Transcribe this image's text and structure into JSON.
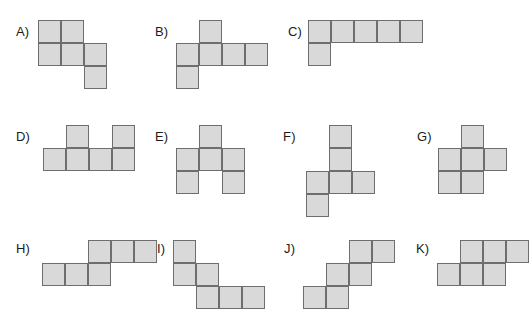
{
  "page": {
    "background_color": "#ffffff",
    "width": 532,
    "height": 327
  },
  "style": {
    "cell_size": 23,
    "cell_fill": "#d9d9d9",
    "cell_stroke": "#6e6e6e",
    "label_color": "#1b1b1b",
    "label_font_size": 13
  },
  "options": [
    {
      "id": "a",
      "label": "A)",
      "label_x": 16,
      "label_y": 25,
      "grid_x": 38,
      "grid_y": 20,
      "cells": [
        [
          0,
          0
        ],
        [
          1,
          0
        ],
        [
          0,
          1
        ],
        [
          1,
          1
        ],
        [
          2,
          1
        ],
        [
          2,
          2
        ]
      ]
    },
    {
      "id": "b",
      "label": "B)",
      "label_x": 155,
      "label_y": 25,
      "grid_x": 176,
      "grid_y": 20,
      "cells": [
        [
          1,
          0
        ],
        [
          0,
          1
        ],
        [
          1,
          1
        ],
        [
          2,
          1
        ],
        [
          3,
          1
        ],
        [
          0,
          2
        ]
      ]
    },
    {
      "id": "c",
      "label": "C)",
      "label_x": 288,
      "label_y": 25,
      "grid_x": 308,
      "grid_y": 20,
      "cells": [
        [
          0,
          0
        ],
        [
          1,
          0
        ],
        [
          2,
          0
        ],
        [
          3,
          0
        ],
        [
          4,
          0
        ],
        [
          0,
          1
        ]
      ]
    },
    {
      "id": "d",
      "label": "D)",
      "label_x": 16,
      "label_y": 130,
      "grid_x": 43,
      "grid_y": 125,
      "cells": [
        [
          1,
          0
        ],
        [
          3,
          0
        ],
        [
          0,
          1
        ],
        [
          1,
          1
        ],
        [
          2,
          1
        ],
        [
          3,
          1
        ]
      ]
    },
    {
      "id": "e",
      "label": "E)",
      "label_x": 155,
      "label_y": 130,
      "grid_x": 176,
      "grid_y": 125,
      "cells": [
        [
          1,
          0
        ],
        [
          0,
          1
        ],
        [
          1,
          1
        ],
        [
          2,
          1
        ],
        [
          0,
          2
        ],
        [
          2,
          2
        ]
      ]
    },
    {
      "id": "f",
      "label": "F)",
      "label_x": 283,
      "label_y": 130,
      "grid_x": 306,
      "grid_y": 125,
      "cells": [
        [
          1,
          0
        ],
        [
          1,
          1
        ],
        [
          0,
          2
        ],
        [
          1,
          2
        ],
        [
          2,
          2
        ],
        [
          0,
          3
        ]
      ]
    },
    {
      "id": "g",
      "label": "G)",
      "label_x": 417,
      "label_y": 130,
      "grid_x": 438,
      "grid_y": 125,
      "cells": [
        [
          1,
          0
        ],
        [
          0,
          1
        ],
        [
          1,
          1
        ],
        [
          2,
          1
        ],
        [
          0,
          2
        ],
        [
          1,
          2
        ]
      ]
    },
    {
      "id": "h",
      "label": "H)",
      "label_x": 16,
      "label_y": 242,
      "grid_x": 42,
      "grid_y": 240,
      "cells": [
        [
          2,
          0
        ],
        [
          3,
          0
        ],
        [
          4,
          0
        ],
        [
          0,
          1
        ],
        [
          1,
          1
        ],
        [
          2,
          1
        ]
      ]
    },
    {
      "id": "i",
      "label": "I)",
      "label_x": 157,
      "label_y": 242,
      "grid_x": 173,
      "grid_y": 240,
      "cells": [
        [
          0,
          0
        ],
        [
          0,
          1
        ],
        [
          1,
          1
        ],
        [
          1,
          2
        ],
        [
          2,
          2
        ],
        [
          3,
          2
        ]
      ]
    },
    {
      "id": "j",
      "label": "J)",
      "label_x": 284,
      "label_y": 242,
      "grid_x": 303,
      "grid_y": 240,
      "cells": [
        [
          2,
          0
        ],
        [
          3,
          0
        ],
        [
          1,
          1
        ],
        [
          2,
          1
        ],
        [
          0,
          2
        ],
        [
          1,
          2
        ]
      ]
    },
    {
      "id": "k",
      "label": "K)",
      "label_x": 416,
      "label_y": 242,
      "grid_x": 437,
      "grid_y": 240,
      "cells": [
        [
          1,
          0
        ],
        [
          2,
          0
        ],
        [
          3,
          0
        ],
        [
          0,
          1
        ],
        [
          1,
          1
        ],
        [
          2,
          1
        ]
      ]
    }
  ]
}
